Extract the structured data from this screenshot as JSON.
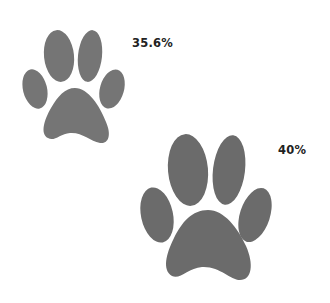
{
  "paws": [
    {
      "id": "small",
      "label": "35.6%",
      "color": "#757575"
    },
    {
      "id": "large",
      "label": "40%",
      "color": "#6b6b6b"
    }
  ]
}
